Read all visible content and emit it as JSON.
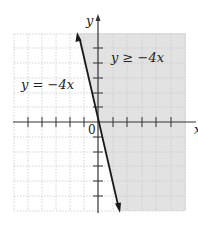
{
  "figure": {
    "type": "inequality-graph",
    "axes": {
      "x_label": "x",
      "y_label": "y",
      "origin_label": "0",
      "x_ticks": [
        -5,
        -4,
        -3,
        -2,
        -1,
        1,
        2,
        3,
        4,
        5
      ],
      "y_ticks": [
        -4,
        -3,
        -2,
        -1,
        1,
        2,
        3,
        4
      ]
    },
    "boundary_line": {
      "label": "y = −4x",
      "slope": -4,
      "intercept": 0,
      "style": "solid"
    },
    "shaded_region": {
      "label": "y ≥ −4x",
      "side": "right of line",
      "color": "#e0e0e0"
    },
    "colors": {
      "grid": "#c8c8c8",
      "axis": "#333333",
      "line": "#1a1a1a",
      "shade": "#e0e0e0"
    }
  }
}
